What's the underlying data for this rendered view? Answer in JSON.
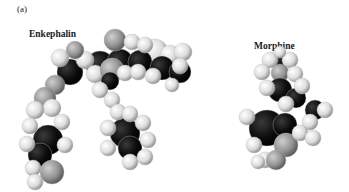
{
  "figure": {
    "panel_label": "(a)",
    "molecules": [
      {
        "name": "Enkephalin"
      },
      {
        "name": "Morphine"
      }
    ],
    "atom_colors": {
      "hydrogen": "#e8e8e8",
      "carbon": "#111111",
      "oxygen": "#8e8e8e",
      "nitrogen": "#6a6a6a"
    }
  }
}
